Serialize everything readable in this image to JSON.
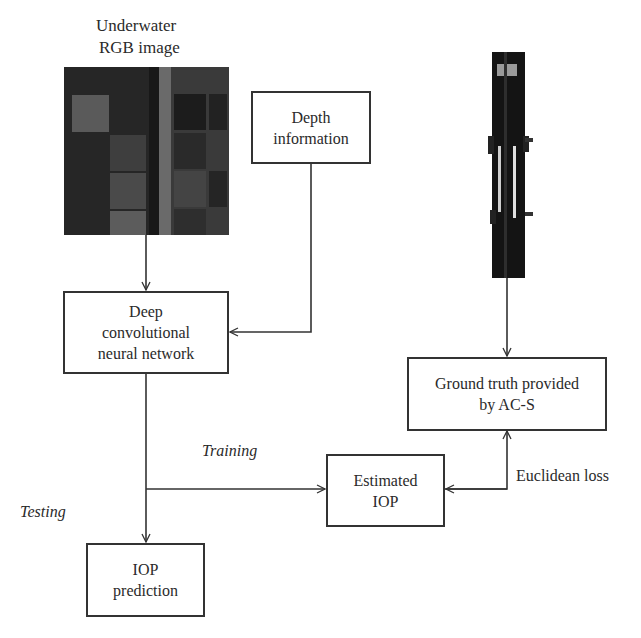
{
  "diagram": {
    "nodes": {
      "rgb_image": {
        "title_line1": "Underwater",
        "title_line2": "RGB image"
      },
      "depth": {
        "line1": "Depth",
        "line2": "information"
      },
      "dcnn": {
        "line1": "Deep",
        "line2": "convolutional",
        "line3": "neural network"
      },
      "ground_truth": {
        "line1": "Ground truth provided",
        "line2": "by AC-S"
      },
      "estimated_iop": {
        "line1": "Estimated",
        "line2": "IOP"
      },
      "iop_prediction": {
        "line1": "IOP",
        "line2": "prediction"
      }
    },
    "edge_labels": {
      "training": "Training",
      "testing": "Testing",
      "euclidean_loss": "Euclidean loss"
    },
    "edges": [
      {
        "from": "rgb_image",
        "to": "dcnn"
      },
      {
        "from": "depth",
        "to": "dcnn"
      },
      {
        "from": "dcnn",
        "to": "iop_prediction",
        "label": "Testing"
      },
      {
        "from": "dcnn",
        "to": "estimated_iop",
        "label": "Training"
      },
      {
        "from": "ac_s_instrument",
        "to": "ground_truth"
      },
      {
        "from": "ground_truth",
        "to": "estimated_iop",
        "label": "Euclidean loss",
        "bidirectional": true
      }
    ],
    "colors": {
      "line": "#333333",
      "box_border": "#333333",
      "text": "#2a2a2a"
    }
  }
}
